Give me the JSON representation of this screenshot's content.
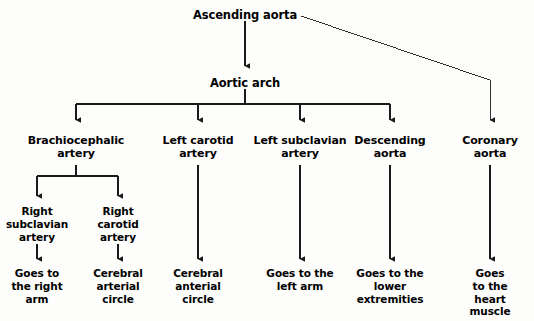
{
  "diagram": {
    "type": "flowchart",
    "line_color": "#1a1a1a",
    "text_color": "#000000",
    "background_color": "#fdfdfb",
    "nodes": {
      "root": "Ascending aorta",
      "arch": "Aortic arch",
      "branch_1": "Brachiocephalic\nartery",
      "branch_2": "Left carotid\nartery",
      "branch_3": "Left subclavian\nartery",
      "branch_4": "Descending\naorta",
      "branch_5": "Coronary\naorta",
      "sub_1a": "Right\nsubclavian\nartery",
      "sub_1b": "Right\ncarotid\nartery",
      "leaf_1a": "Goes to\nthe right\narm",
      "leaf_1b": "Cerebral\narterial\ncircle",
      "leaf_2": "Cerebral\nanterial\ncircle",
      "leaf_3": "Goes to the\nleft arm",
      "leaf_4": "Goes to the\nlower\nextremities",
      "leaf_5": "Goes to the\nheart muscle"
    }
  }
}
